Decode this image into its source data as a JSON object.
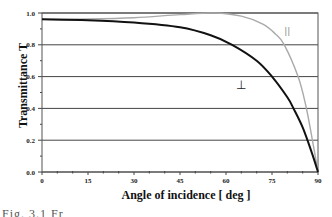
{
  "chart_data": {
    "type": "line",
    "title": "",
    "xlabel": "Angle of incidence [ deg ]",
    "ylabel": "Transmittance T",
    "xlim": [
      0,
      90
    ],
    "ylim": [
      0.0,
      1.0
    ],
    "x_ticks": [
      0,
      15,
      30,
      45,
      60,
      75,
      90
    ],
    "y_ticks": [
      "0.0",
      "0.2",
      "0.4",
      "0.6",
      "0.8",
      "1.0"
    ],
    "grid": "horizontal",
    "series": [
      {
        "name": "⊥",
        "color": "#111111",
        "x": [
          0,
          15,
          30,
          45,
          55,
          62,
          70,
          75,
          80,
          82,
          85,
          88,
          90
        ],
        "y": [
          0.96,
          0.955,
          0.94,
          0.91,
          0.86,
          0.8,
          0.7,
          0.6,
          0.47,
          0.4,
          0.28,
          0.12,
          0.0
        ]
      },
      {
        "name": "∥",
        "color": "#aaaaaa",
        "x": [
          0,
          15,
          30,
          45,
          56,
          65,
          72,
          76,
          79,
          83.5,
          86,
          88,
          90
        ],
        "y": [
          0.96,
          0.962,
          0.97,
          0.99,
          1.0,
          0.98,
          0.93,
          0.87,
          0.8,
          0.6,
          0.42,
          0.22,
          0.0
        ]
      }
    ],
    "annotations": [
      {
        "text": "||",
        "x": 80,
        "y": 0.87
      },
      {
        "text": "⊥",
        "x": 65,
        "y": 0.52
      }
    ]
  },
  "labels": {
    "xlabel": "Angle of incidence [ deg ]",
    "ylabel": "Transmittance T",
    "caption": "Fig. 3.1  Fr"
  }
}
